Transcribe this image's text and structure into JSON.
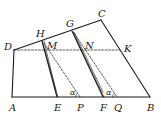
{
  "diagram": {
    "type": "geometry",
    "colors": {
      "stroke": "#1a1a1a",
      "background": "#ffffff"
    },
    "points": {
      "A": {
        "label": "A",
        "x": 12,
        "y": 97
      },
      "B": {
        "label": "B",
        "x": 150,
        "y": 97
      },
      "C": {
        "label": "C",
        "x": 101,
        "y": 20
      },
      "D": {
        "label": "D",
        "x": 14,
        "y": 50
      },
      "H": {
        "label": "H",
        "x": 42,
        "y": 41
      },
      "G": {
        "label": "G",
        "x": 72,
        "y": 31
      },
      "M": {
        "label": "M",
        "x": 46,
        "y": 50
      },
      "N": {
        "label": "N",
        "x": 83,
        "y": 50
      },
      "K": {
        "label": "K",
        "x": 120,
        "y": 50
      },
      "E": {
        "label": "E",
        "x": 57,
        "y": 97
      },
      "P": {
        "label": "P",
        "x": 80,
        "y": 97
      },
      "F": {
        "label": "F",
        "x": 103,
        "y": 97
      },
      "Q": {
        "label": "Q",
        "x": 117,
        "y": 97
      }
    },
    "angles": [
      {
        "label": "α",
        "at": "P"
      },
      {
        "label": "α",
        "at": "Q"
      }
    ]
  }
}
